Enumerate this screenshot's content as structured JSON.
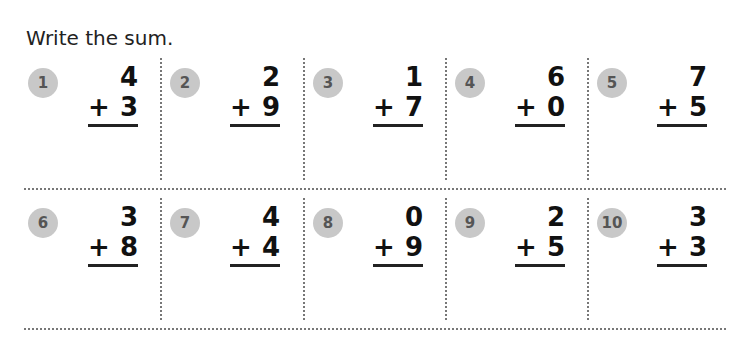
{
  "instruction": "Write the sum.",
  "problems": [
    {
      "num": "1",
      "top": "4",
      "op": "+",
      "bottom": "3"
    },
    {
      "num": "2",
      "top": "2",
      "op": "+",
      "bottom": "9"
    },
    {
      "num": "3",
      "top": "1",
      "op": "+",
      "bottom": "7"
    },
    {
      "num": "4",
      "top": "6",
      "op": "+",
      "bottom": "0"
    },
    {
      "num": "5",
      "top": "7",
      "op": "+",
      "bottom": "5"
    },
    {
      "num": "6",
      "top": "3",
      "op": "+",
      "bottom": "8"
    },
    {
      "num": "7",
      "top": "4",
      "op": "+",
      "bottom": "4"
    },
    {
      "num": "8",
      "top": "0",
      "op": "+",
      "bottom": "9"
    },
    {
      "num": "9",
      "top": "2",
      "op": "+",
      "bottom": "5"
    },
    {
      "num": "10",
      "top": "3",
      "op": "+",
      "bottom": "3"
    }
  ]
}
